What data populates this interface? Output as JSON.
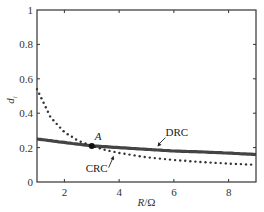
{
  "chart_data": {
    "type": "line",
    "title": "",
    "xlabel": "R/Ω",
    "xlabel_parts": {
      "var": "R",
      "unit": "/Ω"
    },
    "ylabel": "d_i",
    "ylabel_parts": {
      "var": "d",
      "sub": "i"
    },
    "xlim": [
      1,
      9
    ],
    "ylim": [
      0,
      1
    ],
    "xticks": [
      2,
      4,
      6,
      8
    ],
    "xtick_labels": [
      "2",
      "4",
      "6",
      "8"
    ],
    "yticks": [
      0,
      0.2,
      0.4,
      0.6,
      0.8,
      1
    ],
    "ytick_labels": [
      "0",
      "0.2",
      "0.4",
      "0.6",
      "0.8",
      "1"
    ],
    "grid": false,
    "series": [
      {
        "name": "DRC",
        "style": "solid-thick",
        "color": "#444444",
        "x": [
          1,
          2,
          3,
          4,
          5,
          6,
          7,
          8,
          9
        ],
        "values": [
          0.25,
          0.23,
          0.21,
          0.2,
          0.19,
          0.18,
          0.175,
          0.168,
          0.16
        ]
      },
      {
        "name": "CRC",
        "style": "dotted",
        "color": "#333333",
        "x": [
          1,
          1.5,
          2,
          2.5,
          3,
          3.5,
          4,
          5,
          6,
          7,
          8,
          9
        ],
        "values": [
          0.54,
          0.375,
          0.29,
          0.24,
          0.21,
          0.186,
          0.169,
          0.144,
          0.128,
          0.116,
          0.107,
          0.1
        ]
      }
    ],
    "annotations": [
      {
        "text": "A",
        "x": 3.0,
        "y": 0.21,
        "marker": "filled-circle"
      },
      {
        "text": "DRC",
        "target_x": 5.4,
        "target_y": 0.2,
        "arrow": true
      },
      {
        "text": "CRC",
        "target_x": 3.8,
        "target_y": 0.165,
        "arrow": true
      }
    ]
  }
}
